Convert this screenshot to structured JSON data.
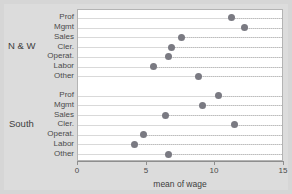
{
  "chart_data": {
    "type": "scatter",
    "title": "",
    "xlabel": "mean of wage",
    "ylabel": "",
    "xlim": [
      0,
      15
    ],
    "xticks": [
      0,
      5,
      10,
      15
    ],
    "xticklabels": [
      "0",
      "5",
      "10",
      "15"
    ],
    "grid": true,
    "legend": "none",
    "groups": [
      {
        "name": "N & W",
        "categories": [
          "Prof",
          "Mgmt",
          "Sales",
          "Cler.",
          "Operat.",
          "Labor",
          "Other"
        ],
        "values": [
          11.2,
          12.1,
          7.5,
          6.8,
          6.6,
          5.5,
          8.8
        ]
      },
      {
        "name": "South",
        "categories": [
          "Prof",
          "Mgmt",
          "Sales",
          "Cler.",
          "Operat.",
          "Labor",
          "Other"
        ],
        "values": [
          10.2,
          9.1,
          6.4,
          11.4,
          4.8,
          4.1,
          6.6
        ]
      }
    ]
  },
  "colors": {
    "dot": "#7a7a82",
    "panel_bg": "#ffffff",
    "figure_bg": "#dcdcdc",
    "outer_bg": "#c9c9c9",
    "grid": "#d9d9d9",
    "axis": "#8e8e8e",
    "text": "#4a4a4a"
  }
}
